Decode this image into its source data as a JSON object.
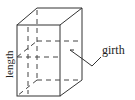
{
  "diagram": {
    "labels": {
      "length": "length",
      "girth": "girth"
    },
    "colors": {
      "line": "#333333",
      "text": "#222222",
      "background": "#ffffff"
    }
  }
}
